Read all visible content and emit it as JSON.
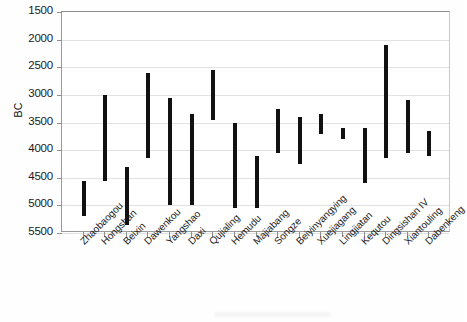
{
  "chart_data": {
    "type": "bar",
    "title": "",
    "xlabel": "",
    "ylabel": "BC",
    "ylim": [
      1500,
      5500
    ],
    "y_inverted": true,
    "grid": true,
    "legend": "none",
    "yticks": [
      1500,
      2000,
      2500,
      3000,
      3500,
      4000,
      4500,
      5000,
      5500
    ],
    "ytick_labels": [
      "1500",
      "2000",
      "2500",
      "3000",
      "3500",
      "4000",
      "4500",
      "5000",
      "5500"
    ],
    "categories": [
      "Zhaobaogou",
      "Hongshan",
      "Beixin",
      "Dawenkou",
      "Yangshao",
      "Daxi",
      "Qujialing",
      "Hemudu",
      "Majiabang",
      "Songze",
      "Beiyinyangying",
      "Xuejiagang",
      "Lingjiatan",
      "Kequtou",
      "Dingsishan IV",
      "Xiantouling",
      "Dabenkeng"
    ],
    "series": [
      {
        "name": "Date range (BC)",
        "type": "range",
        "start": [
          4550,
          4150,
          5350,
          3050,
          4150,
          5050,
          5000,
          4000,
          5050,
          5000,
          4400,
          4100,
          4050,
          4250,
          4600,
          4150,
          4300
        ],
        "end": [
          5200,
          3000,
          4750,
          2600,
          3050,
          3350,
          3350,
          2550,
          3500,
          3600,
          3300,
          3400,
          3350,
          3300,
          3250,
          2100,
          3050
        ]
      }
    ],
    "bars": [
      {
        "label": "Zhaobaogou",
        "top_bc": 4550,
        "bottom_bc": 5200
      },
      {
        "label": "Hongshan",
        "top_bc": 3000,
        "bottom_bc": 4550
      },
      {
        "label": "Beixin",
        "top_bc": 4300,
        "bottom_bc": 5350
      },
      {
        "label": "Dawenkou",
        "top_bc": 2600,
        "bottom_bc": 4150
      },
      {
        "label": "Yangshao",
        "top_bc": 3050,
        "bottom_bc": 5000
      },
      {
        "label": "Daxi",
        "top_bc": 3350,
        "bottom_bc": 5000
      },
      {
        "label": "Qujialing",
        "top_bc": 2550,
        "bottom_bc": 3450
      },
      {
        "label": "Hemudu",
        "top_bc": 3500,
        "bottom_bc": 5050
      },
      {
        "label": "Majiabang",
        "top_bc": 4100,
        "bottom_bc": 5050
      },
      {
        "label": "Songze",
        "top_bc": 3250,
        "bottom_bc": 4050
      },
      {
        "label": "Beiyinyangying",
        "top_bc": 3400,
        "bottom_bc": 4250
      },
      {
        "label": "Xuejiagang",
        "top_bc": 3350,
        "bottom_bc": 3700
      },
      {
        "label": "Lingjiatan",
        "top_bc": 3600,
        "bottom_bc": 3800
      },
      {
        "label": "Kequtou",
        "top_bc": 3600,
        "bottom_bc": 4600
      },
      {
        "label": "Dingsishan IV",
        "top_bc": 2100,
        "bottom_bc": 4150
      },
      {
        "label": "Xiantouling",
        "top_bc": 3100,
        "bottom_bc": 4050
      },
      {
        "label": "Dabenkeng",
        "top_bc": 3650,
        "bottom_bc": 4100
      }
    ]
  }
}
